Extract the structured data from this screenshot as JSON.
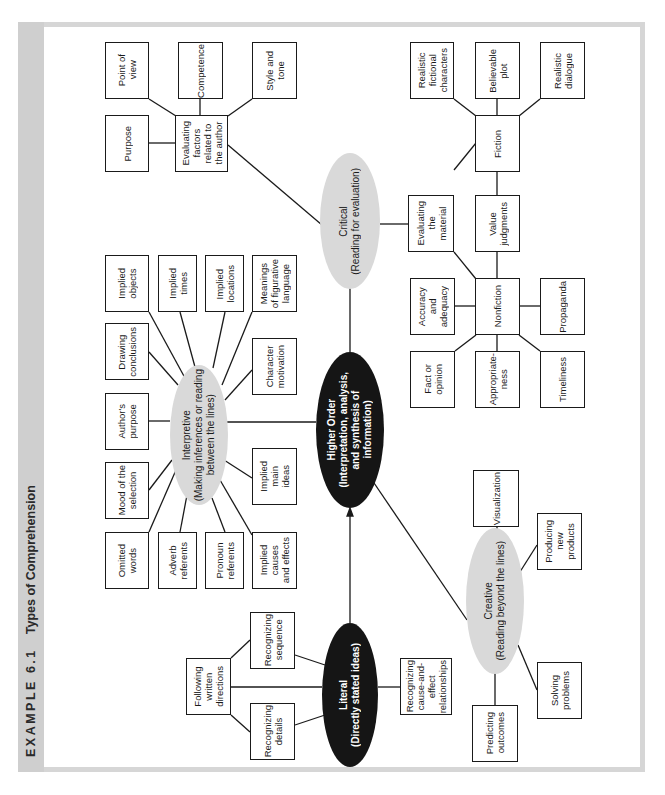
{
  "title": {
    "label": "EXAMPLE 6.1",
    "text": "Types of Comprehension"
  },
  "nodes": {
    "higher_order": "Higher Order\n(Interpretation, analysis,\nand synthesis of\ninformation)",
    "literal": "Literal\n(Directly stated ideas)",
    "interpretive": "Interpretive\n(Making inferences or reading\nbetween the lines)",
    "critical": "Critical\n(Reading for evaluation)",
    "creative": "Creative\n(Reading beyond the lines)",
    "literal_children": {
      "following_directions": "Following\nwritten\ndirections",
      "recognizing_sequence": "Recognizing\nsequence",
      "recognizing_details": "Recognizing\ndetails",
      "recognizing_cause_effect": "Recognizing\ncause-and-\neffect\nrelationships"
    },
    "interpretive_children": {
      "implied_objects": "Implied\nobjects",
      "implied_times": "Implied\ntimes",
      "implied_locations": "Implied\nlocations",
      "figurative_language": "Meanings\nof figurative\nlanguage",
      "drawing_conclusions": "Drawing\nconclusions",
      "character_motivation": "Character\nmotivation",
      "authors_purpose": "Author's\npurpose",
      "mood": "Mood of the\nselection",
      "implied_main_ideas": "Implied\nmain\nideas",
      "omitted_words": "Omitted\nwords",
      "adverb_referents": "Adverb\nreferents",
      "pronoun_referents": "Pronoun\nreferents",
      "implied_causes": "Implied\ncauses\nand effects"
    },
    "critical_children": {
      "evaluating_author": "Evaluating\nfactors\nrelated to\nthe author",
      "point_of_view": "Point of\nview",
      "competence": "Competence",
      "style_tone": "Style and\ntone",
      "purpose": "Purpose",
      "evaluating_material": "Evaluating\nthe\nmaterial",
      "fiction": "Fiction",
      "realistic_characters": "Realistic\nfictional\ncharacters",
      "believable_plot": "Believable\nplot",
      "realistic_dialogue": "Realistic\ndialogue",
      "value_judgments": "Value\njudgments",
      "nonfiction": "Nonfiction",
      "accuracy": "Accuracy\nand\nadequacy",
      "propaganda": "Propaganda",
      "fact_opinion": "Fact or\nopinion",
      "appropriateness": "Appropriate-\nness",
      "timeliness": "Timeliness"
    },
    "creative_children": {
      "visualization": "Visualization",
      "producing_products": "Producing\nnew\nproducts",
      "solving_problems": "Solving\nproblems",
      "predicting_outcomes": "Predicting\noutcomes"
    }
  },
  "colors": {
    "dark_node": "#151515",
    "light_node": "#d9d9d9",
    "frame": "#d6d6d6",
    "title_strip": "#cfcfcf"
  }
}
